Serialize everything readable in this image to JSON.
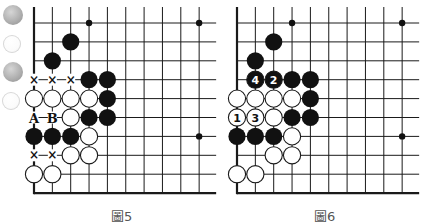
{
  "colors": {
    "line": "#1a1a1a",
    "black_stone": "#111111",
    "white_stone": "#ffffff",
    "deco_gray": "#a9a9a9",
    "caption": "#555555"
  },
  "side_decorations": [
    {
      "kind": "gray",
      "x": 13,
      "y": 15,
      "r": 10
    },
    {
      "kind": "white",
      "x": 12,
      "y": 44,
      "r": 9
    },
    {
      "kind": "gray",
      "x": 13,
      "y": 72,
      "r": 10
    },
    {
      "kind": "white",
      "x": 11,
      "y": 101,
      "r": 9
    }
  ],
  "grid": {
    "cols": 10,
    "rows": 10,
    "spacing_x": 18.35,
    "spacing_y": 18.9,
    "top_extend": 16
  },
  "diagrams": [
    {
      "id": "fig5",
      "caption": "圖5",
      "caption_x": 111,
      "origin_x": 34,
      "origin_y": 23,
      "right_extend": 17,
      "star_points": [
        [
          3,
          0
        ],
        [
          9,
          0
        ],
        [
          9,
          6
        ]
      ],
      "black": [
        [
          2,
          1
        ],
        [
          1,
          2
        ],
        [
          3,
          3
        ],
        [
          4,
          3
        ],
        [
          4,
          4
        ],
        [
          3,
          5
        ],
        [
          4,
          5
        ],
        [
          0,
          6
        ],
        [
          1,
          6
        ],
        [
          2,
          6
        ]
      ],
      "white": [
        [
          0,
          4
        ],
        [
          1,
          4
        ],
        [
          2,
          4
        ],
        [
          3,
          4
        ],
        [
          2,
          5
        ],
        [
          3,
          6
        ],
        [
          2,
          7
        ],
        [
          3,
          7
        ],
        [
          0,
          8
        ],
        [
          1,
          8
        ]
      ],
      "marks": [
        {
          "col": 0,
          "row": 3,
          "text": "×"
        },
        {
          "col": 1,
          "row": 3,
          "text": "×"
        },
        {
          "col": 2,
          "row": 3,
          "text": "×"
        },
        {
          "col": 0,
          "row": 5,
          "text": "A"
        },
        {
          "col": 1,
          "row": 5,
          "text": "B"
        },
        {
          "col": 0,
          "row": 7,
          "text": "×"
        },
        {
          "col": 1,
          "row": 7,
          "text": "×"
        }
      ],
      "numbered": []
    },
    {
      "id": "fig6",
      "caption": "圖6",
      "caption_x": 314,
      "origin_x": 237,
      "origin_y": 23,
      "right_extend": 17,
      "star_points": [
        [
          3,
          0
        ],
        [
          9,
          0
        ],
        [
          9,
          6
        ]
      ],
      "black": [
        [
          2,
          1
        ],
        [
          1,
          2
        ],
        [
          3,
          3
        ],
        [
          4,
          3
        ],
        [
          4,
          4
        ],
        [
          3,
          5
        ],
        [
          4,
          5
        ],
        [
          0,
          6
        ],
        [
          1,
          6
        ],
        [
          2,
          6
        ]
      ],
      "white": [
        [
          0,
          4
        ],
        [
          1,
          4
        ],
        [
          2,
          4
        ],
        [
          3,
          4
        ],
        [
          2,
          5
        ],
        [
          3,
          6
        ],
        [
          2,
          7
        ],
        [
          3,
          7
        ],
        [
          0,
          8
        ],
        [
          1,
          8
        ]
      ],
      "marks": [],
      "numbered": [
        {
          "col": 2,
          "row": 3,
          "color": "black",
          "n": "2"
        },
        {
          "col": 1,
          "row": 3,
          "color": "black",
          "n": "4"
        },
        {
          "col": 0,
          "row": 5,
          "color": "white",
          "n": "1"
        },
        {
          "col": 1,
          "row": 5,
          "color": "white",
          "n": "3"
        }
      ]
    }
  ]
}
